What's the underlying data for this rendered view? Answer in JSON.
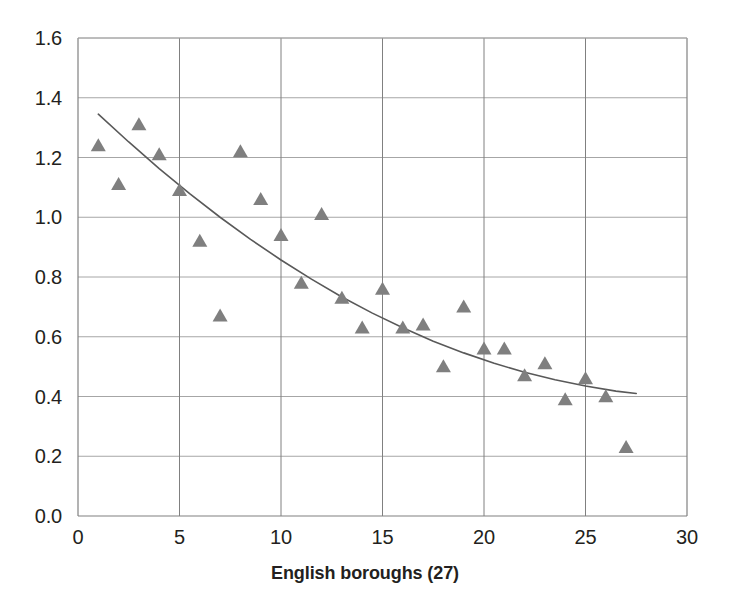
{
  "chart_data": {
    "type": "scatter",
    "title": "",
    "subtitle": "",
    "xlabel": "English boroughs (27)",
    "ylabel": "",
    "xlim": [
      0,
      30
    ],
    "ylim": [
      0.0,
      1.6
    ],
    "xticks": [
      "0",
      "5",
      "10",
      "15",
      "20",
      "25",
      "30"
    ],
    "xtick_values": [
      0,
      5,
      10,
      15,
      20,
      25,
      30
    ],
    "yticks": [
      "0.0",
      "0.2",
      "0.4",
      "0.6",
      "0.8",
      "1.0",
      "1.2",
      "1.4",
      "1.6"
    ],
    "ytick_values": [
      0.0,
      0.2,
      0.4,
      0.6,
      0.8,
      1.0,
      1.2,
      1.4,
      1.6
    ],
    "grid": true,
    "grid_color": "#a6a6a6",
    "legend": "none",
    "marker": "triangle",
    "marker_color": "#7f7f7f",
    "trendline_color": "#595959",
    "x": [
      1,
      2,
      3,
      4,
      5,
      6,
      7,
      8,
      9,
      10,
      11,
      12,
      13,
      14,
      15,
      16,
      17,
      18,
      19,
      20,
      21,
      22,
      23,
      24,
      25,
      26,
      27
    ],
    "values": [
      1.24,
      1.11,
      1.31,
      1.21,
      1.09,
      0.92,
      0.67,
      1.22,
      1.06,
      0.94,
      0.78,
      1.01,
      0.73,
      0.63,
      0.76,
      0.63,
      0.64,
      0.5,
      0.7,
      0.56,
      0.56,
      0.47,
      0.51,
      0.39,
      0.46,
      0.4,
      0.23
    ],
    "series": [
      {
        "name": "English boroughs",
        "values": [
          1.24,
          1.11,
          1.31,
          1.21,
          1.09,
          0.92,
          0.67,
          1.22,
          1.06,
          0.94,
          0.78,
          1.01,
          0.73,
          0.63,
          0.76,
          0.63,
          0.64,
          0.5,
          0.7,
          0.56,
          0.56,
          0.47,
          0.51,
          0.39,
          0.46,
          0.4,
          0.23
        ]
      }
    ],
    "trendline": {
      "type": "power",
      "x": [
        1.0,
        2.5,
        4.0,
        5.5,
        7.0,
        8.5,
        10.0,
        11.5,
        13.0,
        14.5,
        16.0,
        17.5,
        19.0,
        20.5,
        22.0,
        23.5,
        25.0,
        26.5,
        27.5
      ],
      "y": [
        1.345,
        1.252,
        1.163,
        1.079,
        1.0,
        0.926,
        0.857,
        0.793,
        0.733,
        0.679,
        0.63,
        0.585,
        0.546,
        0.511,
        0.481,
        0.456,
        0.435,
        0.418,
        0.41
      ]
    }
  },
  "axis": {
    "x_title": "English boroughs (27)"
  }
}
